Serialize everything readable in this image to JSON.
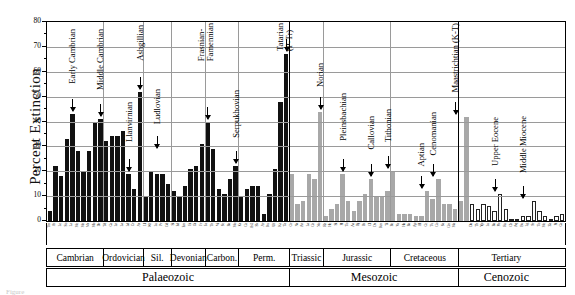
{
  "axis": {
    "y_title": "Percent Extinction",
    "y_ticks": [
      "80",
      "70",
      "60",
      "50",
      "40",
      "30",
      "20",
      "10",
      "0"
    ]
  },
  "caption": "Figure",
  "chart_data": {
    "type": "bar",
    "title": "",
    "xlabel": "",
    "ylabel": "Percent Extinction",
    "ylim": [
      0,
      80
    ],
    "grid": true,
    "legend_position": "none",
    "series": [
      {
        "name": "Palaeozoic",
        "color": "#111111",
        "stages": [
          "Tm",
          "At",
          "Le",
          "So",
          "Lz",
          "Me",
          "Mn",
          "Ms",
          "Mb",
          "Dr",
          "Td",
          "Ca",
          "Ln",
          "La",
          "Ld",
          "Cr",
          "As",
          "Ll",
          "Wf",
          "Lu",
          "Pr",
          "Gd",
          "Si",
          "Ed",
          "Em",
          "Ei",
          "Gi",
          "Fr",
          "Fa",
          "Tn",
          "Vi",
          "Se",
          "Ba",
          "Mo",
          "Ks",
          "Gz",
          "As2",
          "Sk",
          "Ar",
          "Ku",
          "Uf",
          "Kz",
          "Ta"
        ],
        "values": [
          4,
          22,
          18,
          33,
          43,
          28,
          20,
          28,
          40,
          41,
          32,
          34,
          34,
          36,
          19,
          13,
          52,
          10,
          20,
          19,
          19,
          15,
          12,
          10,
          14,
          21,
          22,
          31,
          40,
          29,
          13,
          11,
          17,
          22,
          10,
          13,
          14,
          14,
          3,
          11,
          21,
          48,
          67
        ]
      },
      {
        "name": "Mesozoic",
        "color": "#a8a8a8",
        "stages": [
          "Gr",
          "Ns",
          "An",
          "La",
          "Cn",
          "No",
          "Rh",
          "He",
          "Si",
          "Pl",
          "To",
          "Aa",
          "Bj",
          "Bt",
          "Cl",
          "Ox",
          "Km",
          "Ti",
          "Be",
          "Va",
          "Ha",
          "Ba",
          "Ap",
          "Al",
          "Ce",
          "Tu",
          "Co",
          "Sa",
          "Cm",
          "Ma"
        ],
        "values": [
          19,
          7,
          8,
          19,
          17,
          44,
          2,
          5,
          7,
          19,
          8,
          4,
          8,
          11,
          17,
          10,
          10,
          12,
          20,
          3,
          3,
          3,
          2,
          2,
          12,
          9,
          17,
          7,
          7,
          5,
          8,
          42
        ]
      },
      {
        "name": "Cenozoic",
        "color": "#ffffff",
        "stages": [
          "Da",
          "Th",
          "Yp",
          "Lu",
          "Ba",
          "Pb",
          "Ru",
          "Ch",
          "Aq",
          "Bu",
          "Lg",
          "Sr",
          "To",
          "Me",
          "Za",
          "Pi",
          "Ca"
        ],
        "values": [
          7,
          5,
          7,
          6,
          4,
          11,
          5,
          1,
          1,
          2,
          2,
          8,
          4,
          2,
          1,
          2,
          3
        ]
      }
    ],
    "annotations": [
      {
        "label": "Early Cambrian",
        "value": 43
      },
      {
        "label": "Middle Cambrian",
        "value": 41
      },
      {
        "label": "Llanvirnian",
        "value": 19
      },
      {
        "label": "Ashgillian",
        "value": 52
      },
      {
        "label": "Ludlovian",
        "value": 28
      },
      {
        "label": "Frasnian-\nFamennian",
        "value": 40
      },
      {
        "label": "Serpukhovian",
        "value": 22
      },
      {
        "label": "Tatarian\n(P-Tr)",
        "value": 67
      },
      {
        "label": "Norian",
        "value": 44
      },
      {
        "label": "Pleinsbachian",
        "value": 19
      },
      {
        "label": "Callovian",
        "value": 17
      },
      {
        "label": "Tithonian",
        "value": 20
      },
      {
        "label": "Aptian",
        "value": 12
      },
      {
        "label": "Cenomanian",
        "value": 17
      },
      {
        "label": "Maastrichtian (K-T)",
        "value": 42
      },
      {
        "label": "Upper Eocene",
        "value": 11
      },
      {
        "label": "Middle Miocene",
        "value": 8
      }
    ],
    "periods": [
      {
        "label": "Cambrian"
      },
      {
        "label": "Ordovician"
      },
      {
        "label": "Sil."
      },
      {
        "label": "Devonian"
      },
      {
        "label": "Carbon."
      },
      {
        "label": "Perm."
      },
      {
        "label": "Triassic"
      },
      {
        "label": "Jurassic"
      },
      {
        "label": "Cretaceous"
      },
      {
        "label": "Tertiary"
      }
    ],
    "eras": [
      {
        "label": "Palaeozoic"
      },
      {
        "label": "Mesozoic"
      },
      {
        "label": "Cenozoic"
      }
    ]
  }
}
